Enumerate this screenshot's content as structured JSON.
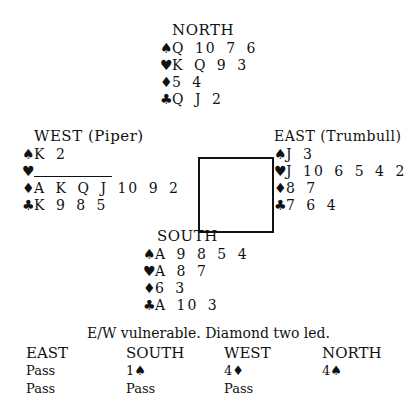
{
  "hands": {
    "north": {
      "title": "NORTH",
      "spades": "Q 10 7 6",
      "hearts": "K Q 9 3",
      "diamonds": "5 4",
      "clubs": "Q J 2"
    },
    "west": {
      "title": "WEST (Piper)",
      "spades": "K 2",
      "hearts": "",
      "diamonds": "A K Q J 10 9 2",
      "clubs": "K 9 8 5"
    },
    "east": {
      "title": "EAST (Trumbull)",
      "spades": "J 3",
      "hearts": "J 10 6 5 4 2",
      "diamonds": "8 7",
      "clubs": "7 6 4"
    },
    "south": {
      "title": "SOUTH",
      "spades": "A 9 8 5 4",
      "hearts": "A 8 7",
      "diamonds": "6 3",
      "clubs": "A 10 3"
    }
  },
  "suits": {
    "spades": "♠",
    "hearts": "♥",
    "diamonds": "♦",
    "clubs": "♣"
  },
  "caption": "E/W vulnerable. Diamond two led.",
  "auction": {
    "headers": [
      "EAST",
      "SOUTH",
      "WEST",
      "NORTH"
    ],
    "rounds": [
      [
        "Pass",
        "1♠",
        "4♦",
        "4♠"
      ],
      [
        "Pass",
        "Pass",
        "Pass",
        ""
      ]
    ]
  }
}
